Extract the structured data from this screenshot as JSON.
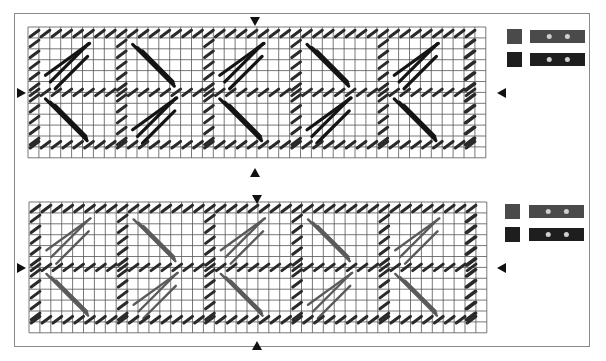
{
  "canvas": {
    "width": 606,
    "height": 361
  },
  "colors": {
    "background": "#ffffff",
    "frame": "#8a8a8a",
    "grid_line": "#555555",
    "stitch_dark": "#141414",
    "stitch_tent": "#2a2a2a",
    "stitch_gray": "#5a5a5a",
    "arrow": "#111111",
    "swatch_top": "#4a4a4a",
    "swatch_bottom": "#1e1e1e",
    "bead": "#cfcfcf"
  },
  "charts": [
    {
      "id": "chart-top",
      "grid": {
        "x": 28,
        "y": 27,
        "cols": 42,
        "rows": 12,
        "cell": 10.9
      },
      "long_stitch_color": "stitch_dark",
      "long_stitch_width": 3.2,
      "center_arrows": {
        "top": [
          255,
          17
        ],
        "bottom": [
          255,
          168
        ],
        "left": [
          17,
          93
        ],
        "right": [
          497,
          93
        ]
      },
      "legend": [
        {
          "swatch": [
            507,
            29,
            15,
            15
          ],
          "color": "swatch_top",
          "strip": [
            530,
            30,
            55,
            13
          ],
          "beads": 2
        },
        {
          "swatch": [
            507,
            52,
            15,
            15
          ],
          "color": "swatch_bottom",
          "strip": [
            530,
            53,
            55,
            13
          ],
          "beads": 2
        }
      ]
    },
    {
      "id": "chart-bottom",
      "grid": {
        "x": 29,
        "y": 202,
        "cols": 42,
        "rows": 12,
        "cell": 10.9
      },
      "long_stitch_color": "stitch_gray",
      "long_stitch_width": 2.4,
      "center_arrows": {
        "top": [
          257,
          195
        ],
        "bottom": [
          257,
          341
        ],
        "left": [
          17,
          268
        ],
        "right": [
          497,
          268
        ]
      },
      "legend": [
        {
          "swatch": [
            505,
            204,
            15,
            15
          ],
          "color": "swatch_top",
          "strip": [
            529,
            205,
            55,
            13
          ],
          "beads": 2
        },
        {
          "swatch": [
            505,
            227,
            15,
            15
          ],
          "color": "swatch_bottom",
          "strip": [
            529,
            228,
            55,
            13
          ],
          "beads": 2
        }
      ]
    }
  ],
  "motif": {
    "repeat_cols": 8,
    "half_rows": 6,
    "description": "mirrored diagonal chevrons bordered by tent stitches"
  }
}
